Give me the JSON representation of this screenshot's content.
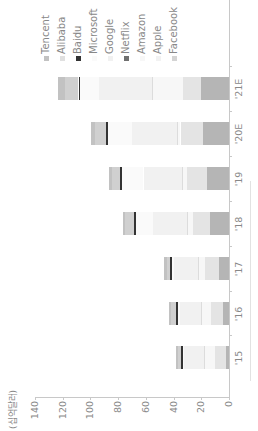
{
  "chart_data": {
    "type": "bar",
    "stacked": true,
    "orientation": "rotated-90-ccw",
    "title": "",
    "unit_label": "(십억달러)",
    "xlabel": "",
    "ylabel": "(십억달러)",
    "ylim": [
      0,
      140
    ],
    "yticks": [
      0,
      20,
      40,
      60,
      80,
      100,
      120,
      140
    ],
    "grid": false,
    "legend_position": "top-right",
    "categories": [
      "'15",
      "'16",
      "'17",
      "'18",
      "'19",
      "'20E",
      "'21E"
    ],
    "series": [
      {
        "name": "Facebook",
        "color": "#b5b5b5",
        "values": [
          2,
          4,
          7,
          14,
          16,
          19,
          20
        ]
      },
      {
        "name": "Apple",
        "color": "#e4e4e4",
        "values": [
          8,
          9,
          10,
          12,
          14,
          16,
          13
        ]
      },
      {
        "name": "Amazon",
        "color": "#f7f7f7",
        "values": [
          8,
          7,
          5,
          4,
          3,
          2,
          22
        ]
      },
      {
        "name": "Netflix",
        "color": "#dcdcdc",
        "values": [
          0.3,
          0.4,
          0.5,
          0.6,
          0.7,
          0.8,
          0.8
        ]
      },
      {
        "name": "Google",
        "color": "#f1f1f1",
        "values": [
          14,
          15,
          17,
          24,
          28,
          32,
          38
        ]
      },
      {
        "name": "Microsoft",
        "color": "#fafafa",
        "values": [
          1.5,
          2,
          2,
          13,
          16,
          18,
          14
        ]
      },
      {
        "name": "Baidu",
        "color": "#333333",
        "values": [
          0.8,
          0.8,
          0.8,
          0.8,
          0.8,
          0.8,
          0.8
        ]
      },
      {
        "name": "Alibaba",
        "color": "#d0d0d0",
        "values": [
          2.5,
          3.6,
          2.7,
          6.3,
          6.1,
          8,
          10
        ]
      },
      {
        "name": "Tencent",
        "color": "#c2c2c2",
        "values": [
          1,
          1.5,
          2,
          2,
          2,
          3,
          5
        ]
      }
    ],
    "totals_approx": [
      38,
      44,
      47,
      77,
      87,
      100,
      124
    ]
  },
  "legend": {
    "items": [
      {
        "label": "Tencent",
        "color": "#c2c2c2"
      },
      {
        "label": "Alibaba",
        "color": "#e0e0e0"
      },
      {
        "label": "Baidu",
        "color": "#333333"
      },
      {
        "label": "Microsoft",
        "color": "#fafafa"
      },
      {
        "label": "Google",
        "color": "#f1f1f1"
      },
      {
        "label": "Netflix",
        "color": "#707070"
      },
      {
        "label": "Amazon",
        "color": "#f7f7f7"
      },
      {
        "label": "Apple",
        "color": "#f2f2f2"
      },
      {
        "label": "Facebook",
        "color": "#d4d4d4"
      }
    ]
  },
  "axis": {
    "unit": "(십억달러)",
    "ticks": [
      "0",
      "20",
      "40",
      "60",
      "80",
      "100",
      "120",
      "140"
    ],
    "categories": [
      "'15",
      "'16",
      "'17",
      "'18",
      "'19",
      "'20E",
      "'21E"
    ]
  }
}
